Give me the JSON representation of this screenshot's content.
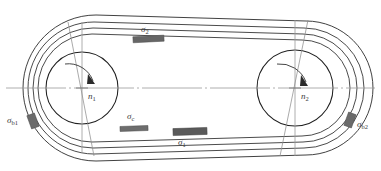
{
  "diagram": {
    "type": "engineering-schematic",
    "canvas": {
      "width": 381,
      "height": 171,
      "background": "#ffffff"
    },
    "colors": {
      "belt_line": "#2b2b2b",
      "pulley_line": "#1f1f1f",
      "centerline": "#9a9a9a",
      "tangent_line": "#8d8d8d",
      "stress_block_dark": "#5e5e5e",
      "stress_block_mid": "#7a7a7a",
      "label_text": "#3a3a3a"
    },
    "pulleys": [
      {
        "name": "driver-pulley",
        "id": "pulley-1",
        "center_x": 82,
        "center_y": 88,
        "radius": 36,
        "rotation_label": "n",
        "rotation_subscript": "1",
        "rotation_direction": "clockwise"
      },
      {
        "name": "driven-pulley",
        "id": "pulley-2",
        "center_x": 295,
        "center_y": 88,
        "radius": 38,
        "rotation_label": "n",
        "rotation_subscript": "2",
        "rotation_direction": "clockwise"
      }
    ],
    "belt": {
      "strand_count": 3,
      "upper_strand": "slack-side",
      "lower_strand": "tight-side"
    },
    "stress_markers": [
      {
        "name": "bending-stress-pulley-1",
        "symbol": "σ",
        "subscript": "b1",
        "label_x": 8,
        "label_y": 118,
        "block_x": 29,
        "block_y": 114,
        "block_w": 8,
        "block_h": 14,
        "block_rotate": -20,
        "shade": "#6b6b6b"
      },
      {
        "name": "slack-side-stress",
        "symbol": "σ",
        "subscript": "2",
        "label_x": 141,
        "label_y": 26,
        "block_x": 133,
        "block_y": 36,
        "block_w": 31,
        "block_h": 6,
        "block_rotate": -3,
        "shade": "#666666"
      },
      {
        "name": "centrifugal-stress",
        "symbol": "σ",
        "subscript": "c",
        "label_x": 127,
        "label_y": 113,
        "block_x": 120,
        "block_y": 126,
        "block_w": 28,
        "block_h": 5,
        "block_rotate": -2,
        "shade": "#6d6d6d"
      },
      {
        "name": "tight-side-stress",
        "symbol": "σ",
        "subscript": "1",
        "label_x": 178,
        "label_y": 140,
        "block_x": 173,
        "block_y": 128,
        "block_w": 34,
        "block_h": 7,
        "block_rotate": -2,
        "shade": "#5a5a5a"
      },
      {
        "name": "bending-stress-pulley-2",
        "symbol": "σ",
        "subscript": "b2",
        "label_x": 356,
        "label_y": 122,
        "block_x": 346,
        "block_y": 113,
        "block_w": 8,
        "block_h": 14,
        "block_rotate": 20,
        "shade": "#6b6b6b"
      }
    ],
    "axis_labels": [
      {
        "name": "rotation-label-n1",
        "symbol": "n",
        "subscript": "1",
        "x": 88,
        "y": 93
      },
      {
        "name": "rotation-label-n2",
        "symbol": "n",
        "subscript": "2",
        "x": 300,
        "y": 93
      }
    ]
  }
}
